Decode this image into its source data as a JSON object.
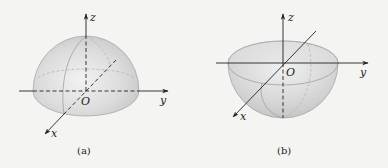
{
  "figure": {
    "panels": [
      {
        "id": "a",
        "caption": "(a)",
        "description": "Upper hemisphere (z >= 0) with coordinate axes",
        "axes": {
          "x": "x",
          "y": "y",
          "z": "z",
          "origin": "O"
        }
      },
      {
        "id": "b",
        "caption": "(b)",
        "description": "Lower hemisphere (z <= 0) with coordinate axes",
        "axes": {
          "x": "x",
          "y": "y",
          "z": "z",
          "origin": "O"
        }
      }
    ],
    "colors": {
      "background": "#f4f4f2",
      "solid_fill": "#d9d9d9",
      "solid_edge": "#9a9a9a",
      "axis": "#222222"
    }
  }
}
